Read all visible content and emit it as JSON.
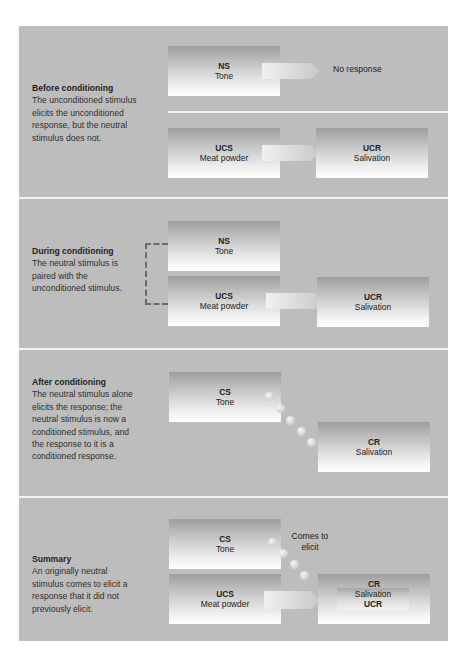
{
  "panels": [
    {
      "id": "before",
      "title": "Before conditioning",
      "description": "The unconditioned stimulus elicits the unconditioned response, but the neutral stimulus does not.",
      "rows": [
        {
          "stimulus": {
            "abbr": "NS",
            "name": "Tone"
          },
          "outcome_text": "No response"
        },
        {
          "stimulus": {
            "abbr": "UCS",
            "name": "Meat powder"
          },
          "response": {
            "abbr": "UCR",
            "name": "Salivation"
          }
        }
      ]
    },
    {
      "id": "during",
      "title": "During conditioning",
      "description": "The neutral stimulus is paired with the unconditioned stimulus.",
      "stimuli": [
        {
          "abbr": "NS",
          "name": "Tone"
        },
        {
          "abbr": "UCS",
          "name": "Meat powder"
        }
      ],
      "response": {
        "abbr": "UCR",
        "name": "Salivation"
      }
    },
    {
      "id": "after",
      "title": "After conditioning",
      "description": "The neutral stimulus alone elicits the response; the neutral stimulus is now a conditioned stimulus, and the response to it is a conditioned response.",
      "stimulus": {
        "abbr": "CS",
        "name": "Tone"
      },
      "response": {
        "abbr": "CR",
        "name": "Salivation"
      }
    },
    {
      "id": "summary",
      "title": "Summary",
      "description": "An originally neutral stimulus comes to elicit a response that it did not previously elicit.",
      "stimuli": [
        {
          "abbr": "CS",
          "name": "Tone"
        },
        {
          "abbr": "UCS",
          "name": "Meat powder"
        }
      ],
      "link_label": "Comes to elicit",
      "response": {
        "top_abbr": "CR",
        "name": "Salivation",
        "bottom_abbr": "UCR"
      }
    }
  ],
  "colors": {
    "panel_bg": "#bdbdbd",
    "divider": "#f2f2f2",
    "bracket": "#6a6a6a"
  }
}
